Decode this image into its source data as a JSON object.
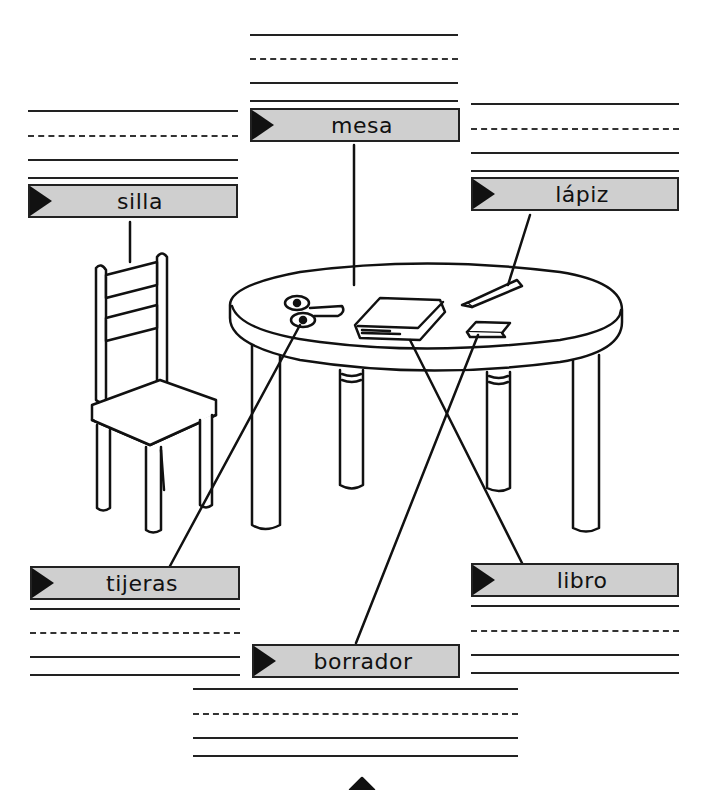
{
  "worksheet": {
    "labels": [
      {
        "id": "mesa",
        "text": "mesa"
      },
      {
        "id": "silla",
        "text": "silla"
      },
      {
        "id": "lapiz",
        "text": "lápiz"
      },
      {
        "id": "tijeras",
        "text": "tijeras"
      },
      {
        "id": "libro",
        "text": "libro"
      },
      {
        "id": "borrador",
        "text": "borrador"
      }
    ],
    "colors": {
      "label_fill": "#cfcfcf",
      "ink": "#111111",
      "paper": "#ffffff"
    }
  }
}
